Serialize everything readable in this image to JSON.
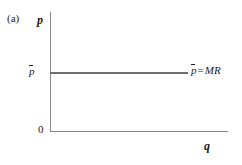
{
  "figure": {
    "panel_label": "(a)",
    "y_axis_label": "p",
    "x_axis_label": "q",
    "origin_label": "0",
    "price_tick_label": "p",
    "annotation": {
      "symbol": "p",
      "equals": "=",
      "term": "MR",
      "full_text": "p̄ = MR"
    },
    "colors": {
      "background": "#ffffff",
      "axis": "#8a8a8a",
      "price_line": "#6e6e6e",
      "text": "#1a1a1a"
    }
  },
  "chart_data": {
    "type": "line",
    "title": "",
    "subtitle": "",
    "xlabel": "q",
    "ylabel": "p",
    "grid": false,
    "legend": "none",
    "xlim": [
      0,
      1
    ],
    "ylim": [
      0,
      1
    ],
    "annotations": [
      "p̄ = MR"
    ],
    "tick_labels": {
      "x": [
        "0"
      ],
      "y": [
        "0",
        "p̄"
      ]
    },
    "series": [
      {
        "name": "p̄ = MR",
        "description": "Horizontal perfectly elastic demand / marginal revenue line at the market price p-bar",
        "x": [
          0,
          0.78
        ],
        "values": [
          0.5,
          0.5
        ]
      }
    ]
  }
}
